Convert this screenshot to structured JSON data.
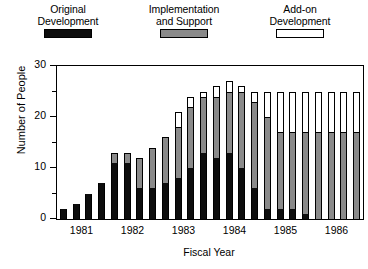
{
  "chart_data": {
    "type": "bar",
    "stacked": true,
    "title": "",
    "xlabel": "Fiscal Year",
    "ylabel": "Number of People",
    "ylim": [
      0,
      30
    ],
    "yticks": [
      0,
      10,
      20,
      30
    ],
    "yminorticks": [
      5,
      15,
      25
    ],
    "grid": false,
    "legend_position": "top",
    "categories": [
      "1981 Q1",
      "1981 Q2",
      "1981 Q3",
      "1981 Q4",
      "1982 Q1",
      "1982 Q2",
      "1982 Q3",
      "1982 Q4",
      "1983 Q1",
      "1983 Q2",
      "1983 Q3",
      "1983 Q4",
      "1984 Q1",
      "1984 Q2",
      "1984 Q3",
      "1984 Q4",
      "1985 Q1",
      "1985 Q2",
      "1985 Q3",
      "1985 Q4",
      "1986 Q1",
      "1986 Q2",
      "1986 Q3",
      "1986 Q4"
    ],
    "xtick_labels": [
      "1981",
      "1982",
      "1983",
      "1984",
      "1985",
      "1986"
    ],
    "series": [
      {
        "name": "Original Development",
        "color": "#0d0d0d",
        "values": [
          2,
          3,
          5,
          7,
          11,
          11,
          6,
          6,
          7,
          8,
          10,
          13,
          12,
          13,
          10,
          6,
          2,
          2,
          2,
          1,
          0,
          0,
          0,
          0
        ]
      },
      {
        "name": "Implementation and Support",
        "color": "#8a8a8a",
        "values": [
          0,
          0,
          0,
          0,
          2,
          2,
          6,
          8,
          9,
          10,
          12,
          11,
          12,
          12,
          15,
          17,
          18,
          15,
          15,
          16,
          17,
          17,
          17,
          17
        ]
      },
      {
        "name": "Add-on Development",
        "color": "#ffffff",
        "values": [
          0,
          0,
          0,
          0,
          0,
          0,
          0,
          0,
          0,
          3,
          2,
          1,
          2,
          2,
          1,
          2,
          5,
          8,
          8,
          8,
          8,
          8,
          8,
          8
        ]
      }
    ]
  },
  "legend": {
    "entries": [
      {
        "label": "Original\nDevelopment",
        "swatch": "black-swatch"
      },
      {
        "label": "Implementation\nand Support",
        "swatch": "gray-swatch"
      },
      {
        "label": "Add-on\nDevelopment",
        "swatch": "white-swatch"
      }
    ]
  },
  "axes": {
    "ylabel": "Number of People",
    "xlabel": "Fiscal Year"
  }
}
